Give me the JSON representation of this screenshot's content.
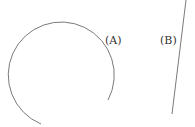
{
  "diagram": {
    "shapes": [
      {
        "id": "A",
        "type": "arc",
        "label": "(A)",
        "stroke": "#777777"
      },
      {
        "id": "B",
        "type": "line",
        "label": "(B)",
        "stroke": "#777777"
      }
    ]
  },
  "labels": {
    "a": "(A)",
    "b": "(B)"
  }
}
